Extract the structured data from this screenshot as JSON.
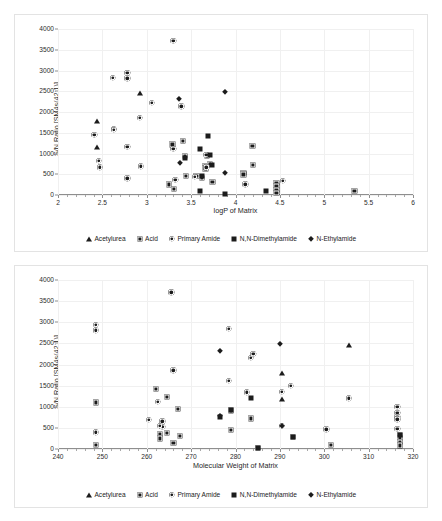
{
  "figure": {
    "panels": [
      {
        "id": "a",
        "label": "a)",
        "xlabel": "logP of Matrix",
        "ylabel": "S/N Ratio [SM4s(42:1)]"
      },
      {
        "id": "b",
        "label": "b)",
        "xlabel": "Molecular Weight of Matrix",
        "ylabel": "S/N Ratio [SM4s(42:1)]"
      }
    ],
    "legend": [
      {
        "label": "Acetylurea",
        "marker": "triangle-marker"
      },
      {
        "label": "Acid",
        "marker": "shaded-square-marker"
      },
      {
        "label": "Primary Amide",
        "marker": "circle-marker"
      },
      {
        "label": "N,N-Dimethylamide",
        "marker": "filled-square-marker"
      },
      {
        "label": "N-Ethylamide",
        "marker": "diamond-marker"
      }
    ]
  },
  "chart_data": [
    {
      "type": "scatter",
      "panel": "a",
      "title": "a)",
      "xlabel": "logP of Matrix",
      "ylabel": "S/N Ratio [SM4s(42:1)]",
      "xlim": [
        2,
        6
      ],
      "ylim": [
        0,
        4000
      ],
      "xticks": [
        2,
        2.5,
        3,
        3.5,
        4,
        4.5,
        5,
        5.5,
        6
      ],
      "yticks": [
        0,
        500,
        1000,
        1500,
        2000,
        2500,
        3000,
        3500,
        4000
      ],
      "grid": true,
      "legend_position": "bottom",
      "series": [
        {
          "name": "Acetylurea",
          "marker": "triangle",
          "points": [
            [
              2.44,
              1775
            ],
            [
              2.44,
              1155
            ],
            [
              2.92,
              2450
            ]
          ]
        },
        {
          "name": "Acid",
          "marker": "shaded-square",
          "points": [
            [
              3.25,
              255
            ],
            [
              3.29,
              1220
            ],
            [
              3.31,
              150
            ],
            [
              3.41,
              1310
            ],
            [
              3.43,
              940
            ],
            [
              3.44,
              455
            ],
            [
              3.56,
              460
            ],
            [
              3.62,
              420
            ],
            [
              3.66,
              690
            ],
            [
              3.66,
              640
            ],
            [
              3.68,
              950
            ],
            [
              3.71,
              745
            ],
            [
              3.74,
              310
            ],
            [
              4.09,
              530
            ],
            [
              4.09,
              495
            ],
            [
              4.19,
              1190
            ],
            [
              4.2,
              725
            ],
            [
              4.46,
              300
            ],
            [
              4.46,
              210
            ],
            [
              4.46,
              130
            ],
            [
              4.46,
              60
            ],
            [
              5.34,
              90
            ]
          ]
        },
        {
          "name": "Primary Amide",
          "marker": "circle",
          "points": [
            [
              2.41,
              1450
            ],
            [
              2.46,
              820
            ],
            [
              2.47,
              665
            ],
            [
              2.62,
              2820
            ],
            [
              2.63,
              1600
            ],
            [
              2.63,
              1565
            ],
            [
              2.78,
              2945
            ],
            [
              2.78,
              2810
            ],
            [
              2.78,
              1155
            ],
            [
              2.78,
              400
            ],
            [
              2.92,
              1860
            ],
            [
              2.93,
              695
            ],
            [
              3.06,
              2225
            ],
            [
              3.3,
              3710
            ],
            [
              3.3,
              1115
            ],
            [
              3.32,
              360
            ],
            [
              3.39,
              2140
            ],
            [
              3.54,
              445
            ],
            [
              3.67,
              975
            ],
            [
              3.67,
              670
            ],
            [
              4.11,
              260
            ],
            [
              4.53,
              345
            ]
          ]
        },
        {
          "name": "N,N-Dimethylamide",
          "marker": "filled-square",
          "points": [
            [
              3.6,
              1105
            ],
            [
              3.62,
              455
            ],
            [
              3.69,
              1415
            ],
            [
              3.71,
              955
            ],
            [
              3.74,
              730
            ],
            [
              3.6,
              100
            ],
            [
              3.88,
              25
            ],
            [
              4.34,
              90
            ],
            [
              3.43,
              885
            ]
          ]
        },
        {
          "name": "N-Ethylamide",
          "marker": "diamond",
          "points": [
            [
              3.36,
              2315
            ],
            [
              3.37,
              775
            ],
            [
              3.88,
              2490
            ],
            [
              3.88,
              540
            ]
          ]
        }
      ]
    },
    {
      "type": "scatter",
      "panel": "b",
      "title": "b)",
      "xlabel": "Molecular Weight of Matrix",
      "ylabel": "S/N Ratio [SM4s(42:1)]",
      "xlim": [
        240,
        320
      ],
      "ylim": [
        0,
        4000
      ],
      "xticks": [
        240,
        250,
        260,
        270,
        280,
        290,
        300,
        310,
        320
      ],
      "yticks": [
        0,
        500,
        1000,
        1500,
        2000,
        2500,
        3000,
        3500,
        4000
      ],
      "grid": true,
      "legend_position": "bottom",
      "series": [
        {
          "name": "Acetylurea",
          "marker": "triangle",
          "points": [
            [
              290.5,
              1800
            ],
            [
              290.5,
              1185
            ],
            [
              305.5,
              2470
            ]
          ]
        },
        {
          "name": "Acid",
          "marker": "shaded-square",
          "points": [
            [
              248.5,
              1105
            ],
            [
              248.5,
              90
            ],
            [
              262,
              1420
            ],
            [
              264.5,
              1225
            ],
            [
              264.5,
              390
            ],
            [
              263,
              360
            ],
            [
              263,
              250
            ],
            [
              266,
              150
            ],
            [
              267,
              955
            ],
            [
              267.5,
              305
            ],
            [
              279,
              915
            ],
            [
              279,
              455
            ],
            [
              283.5,
              725
            ],
            [
              285,
              20
            ],
            [
              293,
              280
            ],
            [
              301.5,
              100
            ],
            [
              317,
              340
            ],
            [
              317,
              255
            ],
            [
              317,
              170
            ],
            [
              317,
              85
            ]
          ]
        },
        {
          "name": "Primary Amide",
          "marker": "circle",
          "points": [
            [
              248.5,
              2945
            ],
            [
              248.5,
              2810
            ],
            [
              248.5,
              395
            ],
            [
              260.5,
              695
            ],
            [
              262.5,
              1115
            ],
            [
              263.5,
              660
            ],
            [
              263.5,
              525
            ],
            [
              266,
              1865
            ],
            [
              263,
              545
            ],
            [
              265.5,
              3710
            ],
            [
              278.5,
              2840
            ],
            [
              278.5,
              1620
            ],
            [
              282.5,
              1345
            ],
            [
              283.5,
              2165
            ],
            [
              284,
              2260
            ],
            [
              290.5,
              1350
            ],
            [
              292.5,
              1490
            ],
            [
              290.5,
              550
            ],
            [
              300.5,
              470
            ],
            [
              305.5,
              1200
            ],
            [
              316.5,
              1005
            ],
            [
              316.5,
              855
            ],
            [
              316.5,
              760
            ],
            [
              316.5,
              700
            ],
            [
              316.5,
              480
            ]
          ]
        },
        {
          "name": "N,N-Dimethylamide",
          "marker": "filled-square",
          "points": [
            [
              276.5,
              760
            ],
            [
              279,
              915
            ],
            [
              283.5,
              1200
            ],
            [
              285,
              20
            ],
            [
              293,
              280
            ],
            [
              317,
              340
            ]
          ]
        },
        {
          "name": "N-Ethylamide",
          "marker": "diamond",
          "points": [
            [
              276.5,
              2320
            ],
            [
              276.5,
              770
            ],
            [
              290,
              2490
            ],
            [
              290.5,
              550
            ]
          ]
        }
      ]
    }
  ]
}
